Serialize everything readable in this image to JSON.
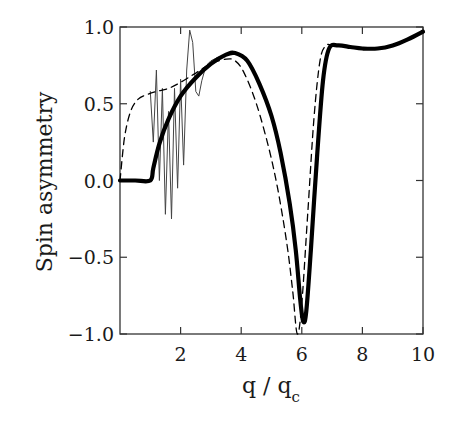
{
  "chart_data": {
    "type": "line",
    "title": "",
    "xlabel": "q / q_c",
    "ylabel": "Spin asymmetry",
    "xlim": [
      0,
      10
    ],
    "ylim": [
      -1.0,
      1.0
    ],
    "xticks": [
      2,
      4,
      6,
      8,
      10
    ],
    "xtick_labels": [
      "2",
      "4",
      "6",
      "8",
      "10"
    ],
    "yticks": [
      1.0,
      0.5,
      0.0,
      -0.5,
      -1.0
    ],
    "ytick_labels": [
      "1.0",
      "0.5",
      "0.0",
      "−0.5",
      "−1.0"
    ],
    "grid": false,
    "legend": null,
    "series": [
      {
        "name": "thick solid",
        "style": "solid-thick",
        "color": "#000000",
        "x": [
          0.0,
          0.5,
          1.0,
          1.1,
          1.3,
          1.6,
          2.0,
          2.5,
          3.0,
          3.5,
          3.8,
          4.2,
          4.6,
          5.0,
          5.3,
          5.6,
          5.8,
          5.95,
          6.05,
          6.15,
          6.3,
          6.5,
          6.7,
          6.9,
          7.2,
          7.6,
          8.0,
          8.5,
          9.0,
          9.5,
          10.0
        ],
        "y": [
          0.0,
          0.0,
          0.0,
          0.08,
          0.24,
          0.4,
          0.55,
          0.67,
          0.76,
          0.82,
          0.83,
          0.78,
          0.63,
          0.42,
          0.18,
          -0.15,
          -0.45,
          -0.78,
          -0.92,
          -0.85,
          -0.45,
          0.15,
          0.65,
          0.86,
          0.88,
          0.87,
          0.86,
          0.86,
          0.88,
          0.92,
          0.97
        ]
      },
      {
        "name": "dashed",
        "style": "dashed",
        "color": "#000000",
        "x": [
          0.0,
          0.15,
          0.35,
          0.6,
          0.9,
          1.2,
          1.6,
          2.0,
          2.5,
          3.0,
          3.5,
          3.8,
          4.1,
          4.5,
          4.9,
          5.2,
          5.5,
          5.7,
          5.85,
          6.0,
          6.2,
          6.4,
          6.6,
          6.8,
          7.0
        ],
        "y": [
          0.0,
          0.28,
          0.45,
          0.53,
          0.56,
          0.58,
          0.6,
          0.64,
          0.7,
          0.76,
          0.79,
          0.78,
          0.7,
          0.5,
          0.22,
          -0.05,
          -0.4,
          -0.72,
          -1.0,
          -0.8,
          -0.2,
          0.4,
          0.78,
          0.88,
          0.88
        ]
      },
      {
        "name": "thin oscillating",
        "style": "solid-thin",
        "color": "#444444",
        "x": [
          1.0,
          1.1,
          1.2,
          1.3,
          1.4,
          1.5,
          1.6,
          1.7,
          1.8,
          1.9,
          2.0,
          2.1,
          2.2,
          2.3,
          2.4,
          2.5,
          2.6,
          2.7,
          2.8,
          2.9,
          3.0,
          3.2,
          3.5
        ],
        "y": [
          0.58,
          0.25,
          0.72,
          0.0,
          0.6,
          -0.22,
          0.45,
          -0.25,
          0.6,
          -0.05,
          0.66,
          0.1,
          0.72,
          0.98,
          0.9,
          0.58,
          0.55,
          0.65,
          0.72,
          0.76,
          0.78,
          0.8,
          0.82
        ]
      }
    ],
    "plot_area_px": {
      "left": 120,
      "top": 27,
      "right": 423,
      "bottom": 334
    }
  }
}
